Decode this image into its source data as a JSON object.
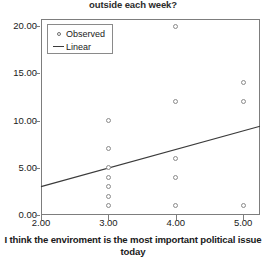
{
  "chart_data": {
    "type": "scatter",
    "title": "outside each week?",
    "title_clipped_prefix": "How many hours do you spend",
    "xlabel": "I think the enviroment is the most important political issue today",
    "ylabel": "",
    "xlim": [
      2.0,
      5.25
    ],
    "ylim": [
      0.0,
      20.75
    ],
    "xticks": [
      "2.00",
      "3.00",
      "4.00",
      "5.00"
    ],
    "xtick_values": [
      2.0,
      3.0,
      4.0,
      5.0
    ],
    "yticks": [
      "0.00",
      "5.00",
      "10.00",
      "15.00",
      "20.00"
    ],
    "ytick_values": [
      0.0,
      5.0,
      10.0,
      15.0,
      20.0
    ],
    "grid": false,
    "legend_position": "top-left",
    "legend": [
      {
        "label": "Observed",
        "marker": "open-circle"
      },
      {
        "label": "Linear",
        "marker": "line"
      }
    ],
    "series": [
      {
        "name": "Observed",
        "marker": "open-circle",
        "color": "#8b8b8b",
        "points": [
          {
            "x": 3.0,
            "y": 10.0
          },
          {
            "x": 3.0,
            "y": 7.0
          },
          {
            "x": 3.0,
            "y": 5.0
          },
          {
            "x": 3.0,
            "y": 4.0
          },
          {
            "x": 3.0,
            "y": 3.0
          },
          {
            "x": 3.0,
            "y": 2.0
          },
          {
            "x": 3.0,
            "y": 1.0
          },
          {
            "x": 4.0,
            "y": 20.0
          },
          {
            "x": 4.0,
            "y": 12.0
          },
          {
            "x": 4.0,
            "y": 6.0
          },
          {
            "x": 4.0,
            "y": 4.0
          },
          {
            "x": 4.0,
            "y": 1.0
          },
          {
            "x": 5.0,
            "y": 14.0
          },
          {
            "x": 5.0,
            "y": 12.0
          },
          {
            "x": 5.0,
            "y": 1.0
          }
        ]
      },
      {
        "name": "Linear",
        "marker": "line",
        "color": "#3b3b3b",
        "fit_endpoints": [
          {
            "x": 2.0,
            "y": 3.0
          },
          {
            "x": 5.25,
            "y": 9.4
          }
        ]
      }
    ]
  }
}
